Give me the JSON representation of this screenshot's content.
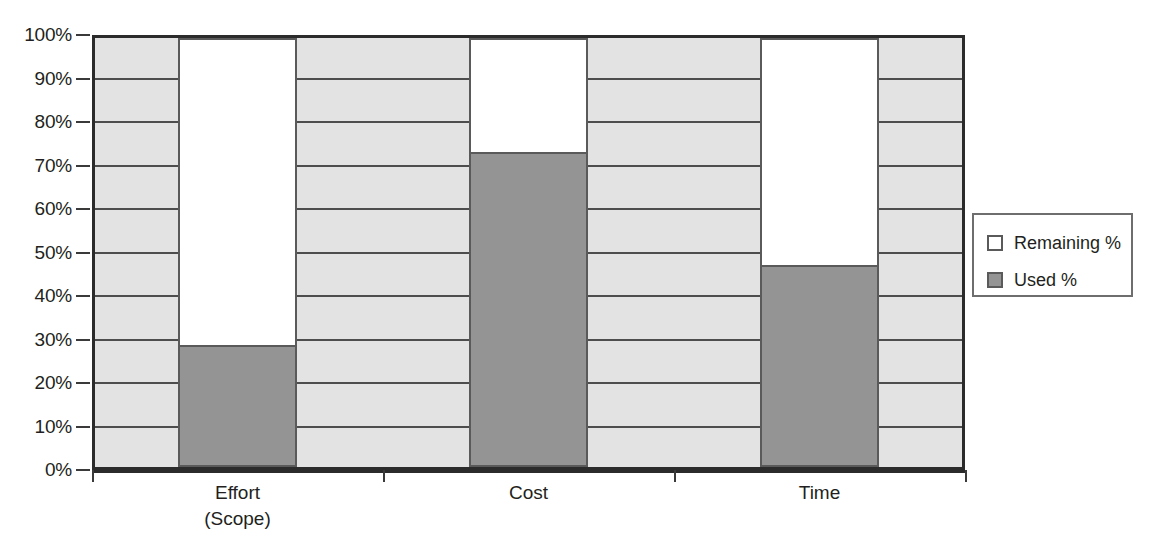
{
  "chart_data": {
    "type": "bar",
    "subtype": "stacked-100-percent",
    "title": "",
    "xlabel": "",
    "ylabel": "",
    "categories": [
      "Effort\n(Scope)",
      "Cost",
      "Time"
    ],
    "category_labels": [
      {
        "line1": "Effort",
        "line2": "(Scope)"
      },
      {
        "line1": "Cost",
        "line2": ""
      },
      {
        "line1": "Time",
        "line2": ""
      }
    ],
    "series": [
      {
        "name": "Remaining %",
        "values": [
          72,
          27.5,
          53.5
        ],
        "color": "#ffffff"
      },
      {
        "name": "Used %",
        "values": [
          28,
          72.5,
          46.5
        ],
        "color": "#949494"
      }
    ],
    "ylim": [
      0,
      100
    ],
    "yticks": [
      0,
      10,
      20,
      30,
      40,
      50,
      60,
      70,
      80,
      90,
      100
    ],
    "ytick_labels": [
      "0%",
      "10%",
      "20%",
      "30%",
      "40%",
      "50%",
      "60%",
      "70%",
      "80%",
      "90%",
      "100%"
    ],
    "grid": true,
    "grid_axis": "y",
    "legend_position": "right",
    "plot_background": "#e3e3e3",
    "axis_color": "#2b2b2b",
    "gridline_color": "#4d4d4d"
  },
  "legend": {
    "entries": [
      {
        "label": "Remaining %",
        "swatch": "white-square-swatch"
      },
      {
        "label": "Used %",
        "swatch": "gray-square-swatch"
      }
    ]
  }
}
